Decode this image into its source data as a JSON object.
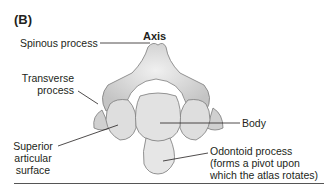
{
  "panel_label": "(B)",
  "title": "Axis",
  "labels": {
    "spinous": "Spinous process",
    "transverse_1": "Transverse",
    "transverse_2": "process",
    "superior_1": "Superior",
    "superior_2": "articular",
    "superior_3": "surface",
    "body": "Body",
    "odontoid_1": "Odontoid process",
    "odontoid_2": "(forms a pivot upon",
    "odontoid_3": "which the atlas rotates)"
  },
  "colors": {
    "bone_fill": "#d6d6d6",
    "bone_light": "#ececec",
    "bone_stroke": "#7a7a7a",
    "leader": "#231f20"
  }
}
